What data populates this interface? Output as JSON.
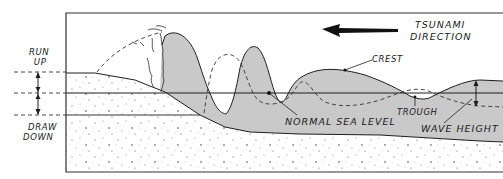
{
  "diagram": {
    "title_label": [
      "TSUNAMI",
      "DIRECTION"
    ],
    "labels": {
      "run_up": [
        "RUN",
        "UP"
      ],
      "draw_down": [
        "DRAW",
        "DOWN"
      ],
      "crest": "CREST",
      "trough": "TROUGH",
      "normal_sea_level": "NORMAL SEA LEVEL",
      "wave_height": "WAVE HEIGHT"
    },
    "colors": {
      "water": "#c9c9c9",
      "ink": "#1f1f1f",
      "ground": "#ffffff",
      "speckle": "#555555"
    },
    "direction_arrow": "left"
  }
}
